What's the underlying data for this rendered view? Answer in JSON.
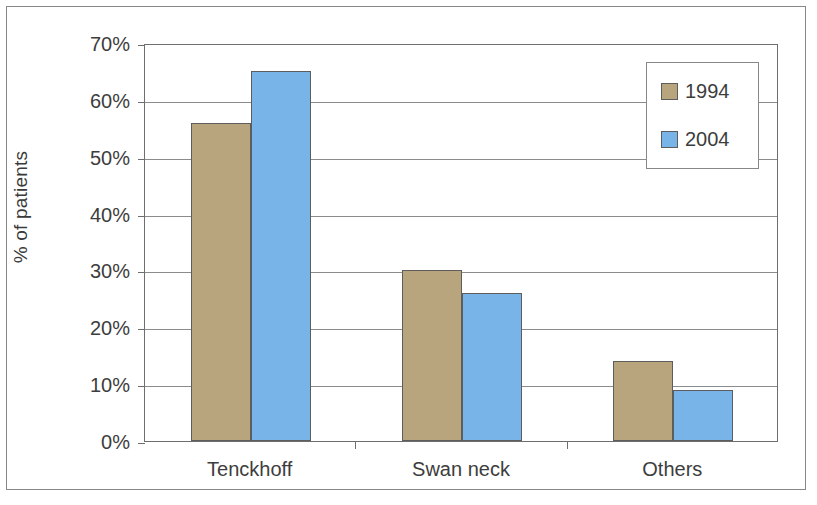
{
  "chart_data": {
    "type": "bar",
    "title": "",
    "subtitle": "",
    "xlabel": "",
    "ylabel": "% of patients",
    "categories": [
      "Tenckhoff",
      "Swan neck",
      "Others"
    ],
    "series": [
      {
        "name": "1994",
        "color": "#b8a57d",
        "values": [
          56,
          30,
          14
        ]
      },
      {
        "name": "2004",
        "color": "#79b4e8",
        "values": [
          65,
          26,
          9
        ]
      }
    ],
    "ylim": [
      0,
      70
    ],
    "ytick_step": 10,
    "ytick_labels": [
      "0%",
      "10%",
      "20%",
      "30%",
      "40%",
      "50%",
      "60%",
      "70%"
    ],
    "ytick_values": [
      0,
      10,
      20,
      30,
      40,
      50,
      60,
      70
    ],
    "value_unit": "%",
    "grid": "horizontal",
    "legend_position": "top-right-inside",
    "legend_entries": [
      "1994",
      "2004"
    ],
    "border": true,
    "background_color": "#ffffff",
    "axis_color": "#6e6e6e",
    "gridline_color": "#8c8c8c",
    "bar_outline_color": "#5d5d5d"
  }
}
